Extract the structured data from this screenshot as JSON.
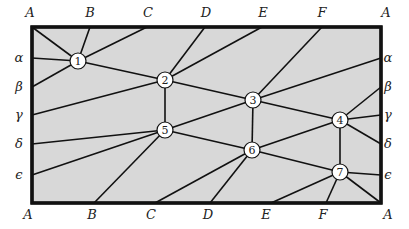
{
  "diagram": {
    "frame": {
      "x": 32,
      "y": 27,
      "width": 349,
      "height": 176,
      "fill": "#d8d8d8",
      "stroke": "#111111"
    },
    "top_labels": [
      {
        "text": "A",
        "x": 30,
        "y": 17
      },
      {
        "text": "B",
        "x": 90,
        "y": 17
      },
      {
        "text": "C",
        "x": 148,
        "y": 17
      },
      {
        "text": "D",
        "x": 206,
        "y": 17
      },
      {
        "text": "E",
        "x": 263,
        "y": 17
      },
      {
        "text": "F",
        "x": 322,
        "y": 17
      },
      {
        "text": "A",
        "x": 386,
        "y": 17
      }
    ],
    "bottom_labels": [
      {
        "text": "A",
        "x": 28,
        "y": 219
      },
      {
        "text": "B",
        "x": 92,
        "y": 219
      },
      {
        "text": "C",
        "x": 151,
        "y": 219
      },
      {
        "text": "D",
        "x": 208,
        "y": 219
      },
      {
        "text": "E",
        "x": 266,
        "y": 219
      },
      {
        "text": "F",
        "x": 323,
        "y": 219
      },
      {
        "text": "A",
        "x": 388,
        "y": 219
      }
    ],
    "left_labels": [
      {
        "text": "α",
        "x": 19,
        "y": 62
      },
      {
        "text": "β",
        "x": 19,
        "y": 91
      },
      {
        "text": "γ",
        "x": 19,
        "y": 119
      },
      {
        "text": "δ",
        "x": 19,
        "y": 148
      },
      {
        "text": "ϵ",
        "x": 19,
        "y": 179
      }
    ],
    "right_labels": [
      {
        "text": "α",
        "x": 388,
        "y": 62
      },
      {
        "text": "β",
        "x": 388,
        "y": 91
      },
      {
        "text": "γ",
        "x": 388,
        "y": 119
      },
      {
        "text": "δ",
        "x": 388,
        "y": 148
      },
      {
        "text": "ϵ",
        "x": 388,
        "y": 179
      }
    ],
    "nodes": [
      {
        "id": "1",
        "x": 78,
        "y": 61
      },
      {
        "id": "2",
        "x": 165,
        "y": 80
      },
      {
        "id": "3",
        "x": 253,
        "y": 100
      },
      {
        "id": "4",
        "x": 340,
        "y": 120
      },
      {
        "id": "5",
        "x": 165,
        "y": 130
      },
      {
        "id": "6",
        "x": 252,
        "y": 150
      },
      {
        "id": "7",
        "x": 340,
        "y": 172
      }
    ],
    "node_radius": 8,
    "edges": [
      {
        "from": [
          78,
          61
        ],
        "to": [
          32,
          27
        ],
        "desc": "1-A(top-left)"
      },
      {
        "from": [
          78,
          61
        ],
        "to": [
          90,
          27
        ],
        "desc": "1-B(top)"
      },
      {
        "from": [
          78,
          61
        ],
        "to": [
          147,
          27
        ],
        "desc": "1-C(top)"
      },
      {
        "from": [
          78,
          61
        ],
        "to": [
          32,
          58
        ],
        "desc": "1-alpha(left)"
      },
      {
        "from": [
          78,
          61
        ],
        "to": [
          32,
          87
        ],
        "desc": "1-beta(left)"
      },
      {
        "from": [
          78,
          61
        ],
        "to": [
          165,
          80
        ],
        "desc": "1-2"
      },
      {
        "from": [
          165,
          80
        ],
        "to": [
          205,
          27
        ],
        "desc": "2-D(top)"
      },
      {
        "from": [
          165,
          80
        ],
        "to": [
          262,
          27
        ],
        "desc": "2-E(top)"
      },
      {
        "from": [
          165,
          80
        ],
        "to": [
          32,
          115
        ],
        "desc": "2-gamma(left)"
      },
      {
        "from": [
          165,
          80
        ],
        "to": [
          253,
          100
        ],
        "desc": "2-3"
      },
      {
        "from": [
          165,
          80
        ],
        "to": [
          165,
          130
        ],
        "desc": "2-5"
      },
      {
        "from": [
          253,
          100
        ],
        "to": [
          322,
          27
        ],
        "desc": "3-F(top)"
      },
      {
        "from": [
          253,
          100
        ],
        "to": [
          381,
          58
        ],
        "desc": "3-alpha(right)"
      },
      {
        "from": [
          253,
          100
        ],
        "to": [
          340,
          120
        ],
        "desc": "3-4"
      },
      {
        "from": [
          253,
          100
        ],
        "to": [
          252,
          150
        ],
        "desc": "3-6"
      },
      {
        "from": [
          253,
          100
        ],
        "to": [
          165,
          130
        ],
        "desc": "3-5"
      },
      {
        "from": [
          340,
          120
        ],
        "to": [
          381,
          87
        ],
        "desc": "4-beta(right)"
      },
      {
        "from": [
          340,
          120
        ],
        "to": [
          381,
          115
        ],
        "desc": "4-gamma(right)"
      },
      {
        "from": [
          340,
          120
        ],
        "to": [
          381,
          144
        ],
        "desc": "4-delta(right)"
      },
      {
        "from": [
          340,
          120
        ],
        "to": [
          340,
          172
        ],
        "desc": "4-7"
      },
      {
        "from": [
          340,
          120
        ],
        "to": [
          252,
          150
        ],
        "desc": "4-6"
      },
      {
        "from": [
          165,
          130
        ],
        "to": [
          32,
          144
        ],
        "desc": "5-delta(left)"
      },
      {
        "from": [
          165,
          130
        ],
        "to": [
          32,
          175
        ],
        "desc": "5-epsilon(left)"
      },
      {
        "from": [
          165,
          130
        ],
        "to": [
          94,
          203
        ],
        "desc": "5-B(bottom)"
      },
      {
        "from": [
          165,
          130
        ],
        "to": [
          252,
          150
        ],
        "desc": "5-6"
      },
      {
        "from": [
          252,
          150
        ],
        "to": [
          155,
          203
        ],
        "desc": "6-C(bottom)"
      },
      {
        "from": [
          252,
          150
        ],
        "to": [
          210,
          203
        ],
        "desc": "6-D(bottom)"
      },
      {
        "from": [
          252,
          150
        ],
        "to": [
          340,
          172
        ],
        "desc": "6-7"
      },
      {
        "from": [
          340,
          172
        ],
        "to": [
          271,
          203
        ],
        "desc": "7-E(bottom)"
      },
      {
        "from": [
          340,
          172
        ],
        "to": [
          326,
          203
        ],
        "desc": "7-F(bottom)"
      },
      {
        "from": [
          340,
          172
        ],
        "to": [
          381,
          203
        ],
        "desc": "7-A(bottom-right)"
      },
      {
        "from": [
          340,
          172
        ],
        "to": [
          381,
          175
        ],
        "desc": "7-epsilon(right)"
      }
    ]
  }
}
